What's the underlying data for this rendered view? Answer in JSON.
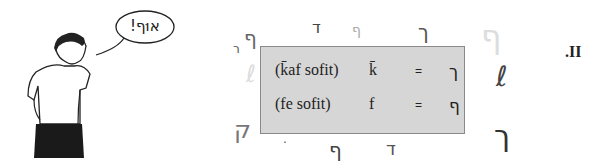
{
  "cartoon": {
    "description": "man-with-hands-in-pockets",
    "speech_bubble": "!אוּף"
  },
  "table": {
    "rows": [
      {
        "name": "(k̄af sofit)",
        "translit": "k̄",
        "eq": "=",
        "letter": "ך"
      },
      {
        "name": "(fe sofit)",
        "translit": "f",
        "eq": "=",
        "letter": "ף"
      }
    ],
    "background": "#d6d6d6"
  },
  "scattered_letters": [
    {
      "glyph": "ר",
      "x": 233,
      "y": 42,
      "size": 12,
      "color": "#555"
    },
    {
      "glyph": "ף",
      "x": 244,
      "y": 26,
      "size": 20,
      "color": "#666"
    },
    {
      "glyph": "ד",
      "x": 312,
      "y": 18,
      "size": 16,
      "color": "#444"
    },
    {
      "glyph": "ף",
      "x": 352,
      "y": 22,
      "size": 14,
      "color": "#aaa"
    },
    {
      "glyph": "ך",
      "x": 418,
      "y": 20,
      "size": 20,
      "color": "#555"
    },
    {
      "glyph": "ף",
      "x": 481,
      "y": 18,
      "size": 32,
      "color": "#ddd"
    },
    {
      "glyph": "ℓ",
      "x": 246,
      "y": 60,
      "size": 24,
      "color": "#ddd"
    },
    {
      "glyph": "ℓ",
      "x": 496,
      "y": 60,
      "size": 28,
      "color": "#444"
    },
    {
      "glyph": "ך",
      "x": 494,
      "y": 118,
      "size": 30,
      "color": "#333"
    },
    {
      "glyph": "ק",
      "x": 234,
      "y": 116,
      "size": 24,
      "color": "#777"
    },
    {
      "glyph": "ף",
      "x": 329,
      "y": 138,
      "size": 20,
      "color": "#444"
    },
    {
      "glyph": "ד",
      "x": 386,
      "y": 138,
      "size": 18,
      "color": "#555"
    },
    {
      "glyph": "·",
      "x": 283,
      "y": 136,
      "size": 12,
      "color": "#555"
    }
  ],
  "section_label": ".II"
}
